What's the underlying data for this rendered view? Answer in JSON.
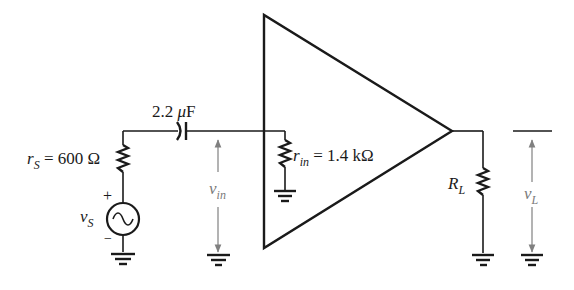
{
  "diagram": {
    "title": "",
    "type": "amplifier circuit",
    "components": {
      "source": {
        "symbol_main": "v",
        "symbol_sub": "S",
        "plus": "+",
        "minus": "−"
      },
      "source_resistance": {
        "symbol_main": "r",
        "symbol_sub": "S",
        "value": " = 600 Ω"
      },
      "coupling_capacitor": {
        "value_num": "2.2 ",
        "value_mu": "μ",
        "value_unit": "F"
      },
      "input_resistance": {
        "symbol_main": "r",
        "symbol_sub": "in",
        "value": " = 1.4 kΩ"
      },
      "load_resistor": {
        "symbol_main": "R",
        "symbol_sub": "L"
      },
      "input_voltage": {
        "symbol_main": "v",
        "symbol_sub": "in"
      },
      "load_voltage": {
        "symbol_main": "v",
        "symbol_sub": "L"
      }
    },
    "colors": {
      "line": "#1a1a1a",
      "arrow": "#808080"
    }
  }
}
